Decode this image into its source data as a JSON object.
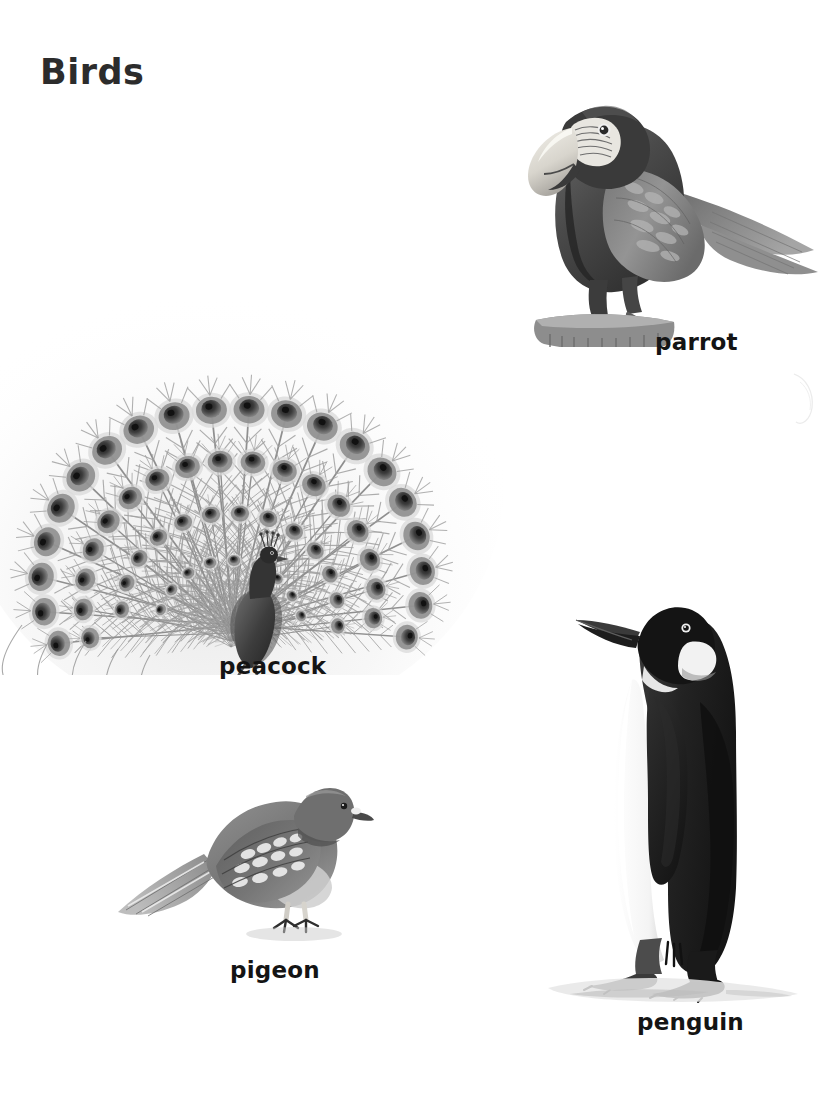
{
  "page": {
    "title": "Birds",
    "background_color": "#ffffff",
    "title_color": "#2c2c2c",
    "caption_color": "#141414",
    "width": 818,
    "height": 1110
  },
  "figures": [
    {
      "id": "peacock",
      "caption": "peacock",
      "subject": "peacock with fully fanned tail",
      "illustration_style": "grayscale pencil and watercolour illustration",
      "caption_position": {
        "x": 219,
        "y": 653
      },
      "bounds": {
        "x": -18,
        "y": 155,
        "width": 560,
        "height": 520
      },
      "details": {
        "eye_spot_count": 68,
        "fan_center": {
          "x": 240,
          "y": 520
        },
        "body_tone": "#4a4a4a",
        "feather_tone": "#8d8d8d"
      }
    },
    {
      "id": "parrot",
      "caption": "parrot",
      "subject": "macaw parrot perched on a stump",
      "illustration_style": "grayscale pencil and watercolour illustration",
      "caption_position": {
        "x": 655,
        "y": 329
      },
      "bounds": {
        "x": 462,
        "y": 72,
        "width": 360,
        "height": 275
      },
      "details": {
        "beak_tone": "#e4e2dc",
        "body_tone": "#5d5d5d",
        "wing_tone": "#8a8a8a",
        "facing": "left"
      }
    },
    {
      "id": "pigeon",
      "caption": "pigeon",
      "subject": "pigeon standing, wing scalloped with pale markings",
      "illustration_style": "grayscale pencil and watercolour illustration",
      "caption_position": {
        "x": 230,
        "y": 957
      },
      "bounds": {
        "x": 112,
        "y": 762,
        "width": 262,
        "height": 190
      },
      "details": {
        "body_tone": "#7c7c7c",
        "wing_tone": "#5a5a5a",
        "facing": "right"
      }
    },
    {
      "id": "penguin",
      "caption": "penguin",
      "subject": "emperor penguin standing on snow",
      "illustration_style": "grayscale pencil and watercolour illustration",
      "caption_position": {
        "x": 637,
        "y": 1009
      },
      "bounds": {
        "x": 540,
        "y": 592,
        "width": 262,
        "height": 418
      },
      "details": {
        "back_tone": "#2a2a2a",
        "belly_tone": "#fbfbfb",
        "head_tone": "#1e1e1e",
        "facing": "left"
      }
    }
  ]
}
